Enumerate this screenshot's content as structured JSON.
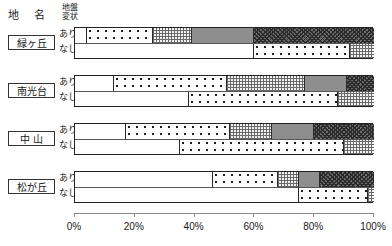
{
  "header": {
    "place_name_label": "地 名",
    "condition_label_line1": "地盤",
    "condition_label_line2": "変状"
  },
  "row_labels": {
    "ari": "あり",
    "nashi": "なし"
  },
  "axis": {
    "ticks": [
      "0%",
      "20%",
      "40%",
      "60%",
      "80%",
      "100%"
    ],
    "tick_values": [
      0,
      20,
      40,
      60,
      80,
      100
    ],
    "min": 0,
    "max": 100
  },
  "colors": {
    "frame": "#222222",
    "gray_segment": "#8e8e8e",
    "dark_segment": "#6e6e6e",
    "axis": "#8a8a8a",
    "text": "#1a1a1a"
  },
  "groups": [
    {
      "name": "緑ヶ丘"
    },
    {
      "name": "南光台"
    },
    {
      "name": "中 山"
    },
    {
      "name": "松が丘"
    }
  ],
  "chart_data": {
    "type": "bar",
    "orientation": "horizontal",
    "stacked": true,
    "normalized": true,
    "title": "",
    "xlabel": "",
    "ylabel": "",
    "xlim": [
      0,
      100
    ],
    "xticks": [
      0,
      20,
      40,
      60,
      80,
      100
    ],
    "xticklabels": [
      "0%",
      "20%",
      "40%",
      "60%",
      "80%",
      "100%"
    ],
    "grid": false,
    "legend": "none",
    "categories": [
      "緑ヶ丘",
      "南光台",
      "中 山",
      "松が丘"
    ],
    "subcategories": [
      "あり",
      "なし"
    ],
    "segment_patterns": [
      "white",
      "dots",
      "hatch",
      "gray",
      "dark"
    ],
    "bars": [
      {
        "group": "緑ヶ丘",
        "row": "あり",
        "segments": [
          {
            "pattern": "white",
            "value": 4
          },
          {
            "pattern": "dots",
            "value": 22
          },
          {
            "pattern": "hatch",
            "value": 13
          },
          {
            "pattern": "gray",
            "value": 21
          },
          {
            "pattern": "dark",
            "value": 40
          }
        ]
      },
      {
        "group": "緑ヶ丘",
        "row": "なし",
        "segments": [
          {
            "pattern": "white",
            "value": 60
          },
          {
            "pattern": "dots",
            "value": 32
          },
          {
            "pattern": "hatch",
            "value": 8
          }
        ]
      },
      {
        "group": "南光台",
        "row": "あり",
        "segments": [
          {
            "pattern": "white",
            "value": 13
          },
          {
            "pattern": "dots",
            "value": 38
          },
          {
            "pattern": "hatch",
            "value": 26
          },
          {
            "pattern": "gray",
            "value": 14
          },
          {
            "pattern": "dark",
            "value": 9
          }
        ]
      },
      {
        "group": "南光台",
        "row": "なし",
        "segments": [
          {
            "pattern": "white",
            "value": 38
          },
          {
            "pattern": "dots",
            "value": 50
          },
          {
            "pattern": "hatch",
            "value": 12
          }
        ]
      },
      {
        "group": "中 山",
        "row": "あり",
        "segments": [
          {
            "pattern": "white",
            "value": 17
          },
          {
            "pattern": "dots",
            "value": 35
          },
          {
            "pattern": "hatch",
            "value": 14
          },
          {
            "pattern": "gray",
            "value": 14
          },
          {
            "pattern": "dark",
            "value": 20
          }
        ]
      },
      {
        "group": "中 山",
        "row": "なし",
        "segments": [
          {
            "pattern": "white",
            "value": 35
          },
          {
            "pattern": "dots",
            "value": 55
          },
          {
            "pattern": "hatch",
            "value": 10
          }
        ]
      },
      {
        "group": "松が丘",
        "row": "あり",
        "segments": [
          {
            "pattern": "white",
            "value": 46
          },
          {
            "pattern": "dots",
            "value": 22
          },
          {
            "pattern": "hatch",
            "value": 7
          },
          {
            "pattern": "gray",
            "value": 7
          },
          {
            "pattern": "dark",
            "value": 18
          }
        ]
      },
      {
        "group": "松が丘",
        "row": "なし",
        "segments": [
          {
            "pattern": "white",
            "value": 75
          },
          {
            "pattern": "dots",
            "value": 23
          },
          {
            "pattern": "hatch",
            "value": 2
          }
        ]
      }
    ]
  }
}
